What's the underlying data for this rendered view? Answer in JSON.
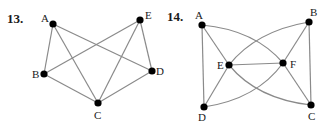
{
  "figures": [
    {
      "number": "13.",
      "nodes": [
        {
          "id": "A",
          "x": 53,
          "y": 24,
          "label": "A",
          "lx": 41,
          "ly": 21
        },
        {
          "id": "E",
          "x": 140,
          "y": 20,
          "label": "E",
          "lx": 145,
          "ly": 18
        },
        {
          "id": "B",
          "x": 44,
          "y": 74,
          "label": "B",
          "lx": 32,
          "ly": 78
        },
        {
          "id": "D",
          "x": 152,
          "y": 71,
          "label": "D",
          "lx": 156,
          "ly": 75
        },
        {
          "id": "C",
          "x": 98,
          "y": 103,
          "label": "C",
          "lx": 94,
          "ly": 119
        }
      ],
      "edges": [
        [
          "A",
          "B"
        ],
        [
          "A",
          "C"
        ],
        [
          "A",
          "D"
        ],
        [
          "E",
          "B"
        ],
        [
          "E",
          "C"
        ],
        [
          "E",
          "D"
        ],
        [
          "B",
          "C"
        ],
        [
          "C",
          "D"
        ]
      ]
    },
    {
      "number": "14.",
      "nodes": [
        {
          "id": "A",
          "x": 202,
          "y": 25,
          "label": "A",
          "lx": 194,
          "ly": 20
        },
        {
          "id": "B",
          "x": 309,
          "y": 22,
          "label": "B",
          "lx": 310,
          "ly": 17
        },
        {
          "id": "E",
          "x": 229,
          "y": 65,
          "label": "E",
          "lx": 216,
          "ly": 69
        },
        {
          "id": "F",
          "x": 283,
          "y": 63,
          "label": "F",
          "lx": 290,
          "ly": 68
        },
        {
          "id": "D",
          "x": 204,
          "y": 107,
          "label": "D",
          "lx": 198,
          "ly": 121
        },
        {
          "id": "C",
          "x": 311,
          "y": 105,
          "label": "C",
          "lx": 309,
          "ly": 120
        }
      ],
      "edges": [
        [
          "A",
          "D"
        ],
        [
          "A",
          "E"
        ],
        [
          "A",
          "F",
          "curve"
        ],
        [
          "B",
          "E",
          "curve"
        ],
        [
          "B",
          "F"
        ],
        [
          "B",
          "C"
        ],
        [
          "E",
          "F"
        ],
        [
          "D",
          "E"
        ],
        [
          "D",
          "F",
          "curve"
        ],
        [
          "E",
          "C",
          "curve"
        ],
        [
          "F",
          "C"
        ]
      ]
    }
  ]
}
